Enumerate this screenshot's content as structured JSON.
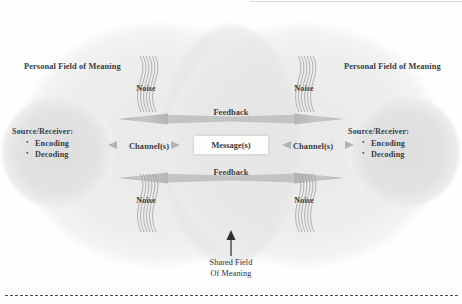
{
  "diagram": {
    "left_side": {
      "field_label_line1": "Personal Field",
      "field_label_line2": "of Meaning",
      "source_receiver_heading": "Source/Receiver:",
      "source_receiver_items": [
        "Encoding",
        "Decoding"
      ]
    },
    "right_side": {
      "field_label_line1": "Personal Field",
      "field_label_line2": "of Meaning",
      "source_receiver_heading": "Source/Receiver:",
      "source_receiver_items": [
        "Encoding",
        "Decoding"
      ]
    },
    "center": {
      "message_label": "Message(s)",
      "channel_left_label": "Channel(s)",
      "channel_right_label": "Channel(s)",
      "feedback_top_label": "Feedback",
      "feedback_bottom_label": "Feedback"
    },
    "noise_labels": {
      "top_left": "Noise",
      "top_right": "Noise",
      "bottom_left": "Noise",
      "bottom_right": "Noise"
    },
    "caption": {
      "line1": "Shared Field",
      "line2": "Of Meaning"
    },
    "colors": {
      "outer_field": "#eeeeee",
      "inner_circle": "#e0e0e0",
      "overlap_shared": "#e6e6e6",
      "arrow_gray": "#b9b9b9",
      "noise_stroke": "#9a9a9a",
      "text": "#3a3a3f",
      "message_box": "#fdfdfb",
      "page_background": "#fefefe",
      "dotted_rule": "#4a4a4a"
    }
  }
}
